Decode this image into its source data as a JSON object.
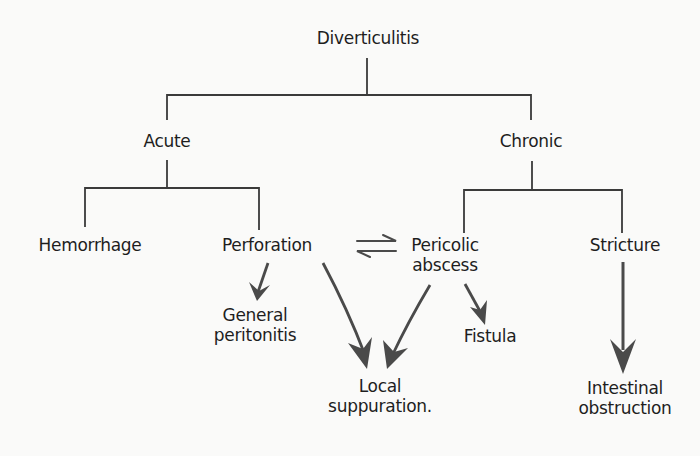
{
  "diagram": {
    "root": {
      "label": "Diverticulitis"
    },
    "branches": {
      "acute": {
        "label": "Acute"
      },
      "chronic": {
        "label": "Chronic"
      }
    },
    "nodes": {
      "hemorrhage": {
        "lines": [
          "Hemorrhage"
        ]
      },
      "perforation": {
        "lines": [
          "Perforation"
        ]
      },
      "pericolic_abscess": {
        "lines": [
          "Pericolic",
          "abscess"
        ]
      },
      "stricture": {
        "lines": [
          "Stricture"
        ]
      },
      "general_peritonitis": {
        "lines": [
          "General",
          "peritonitis"
        ]
      },
      "local_suppuration": {
        "lines": [
          "Local",
          "suppuration."
        ]
      },
      "fistula": {
        "lines": [
          "Fistula"
        ]
      },
      "intestinal_obstruction": {
        "lines": [
          "Intestinal",
          "obstruction"
        ]
      }
    },
    "edges": [
      {
        "from": "Diverticulitis",
        "to": "Acute",
        "type": "tree"
      },
      {
        "from": "Diverticulitis",
        "to": "Chronic",
        "type": "tree"
      },
      {
        "from": "Acute",
        "to": "Hemorrhage",
        "type": "tree"
      },
      {
        "from": "Acute",
        "to": "Perforation",
        "type": "tree"
      },
      {
        "from": "Chronic",
        "to": "Pericolic abscess",
        "type": "tree"
      },
      {
        "from": "Chronic",
        "to": "Stricture",
        "type": "tree"
      },
      {
        "from": "Perforation",
        "to": "Pericolic abscess",
        "type": "reversible"
      },
      {
        "from": "Perforation",
        "to": "General peritonitis",
        "type": "arrow"
      },
      {
        "from": "Perforation",
        "to": "Local suppuration",
        "type": "arrow"
      },
      {
        "from": "Pericolic abscess",
        "to": "Local suppuration",
        "type": "arrow"
      },
      {
        "from": "Pericolic abscess",
        "to": "Fistula",
        "type": "arrow"
      },
      {
        "from": "Stricture",
        "to": "Intestinal obstruction",
        "type": "arrow"
      }
    ],
    "colors": {
      "background": "#fafaf9",
      "text": "#1e1e1e",
      "tree_line": "#3a3a3a",
      "arrow": "#4a4a4a"
    }
  }
}
